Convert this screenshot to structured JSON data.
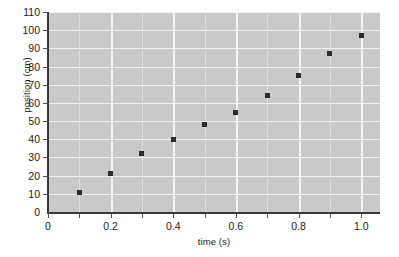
{
  "chart_data": {
    "type": "scatter",
    "title": "",
    "xlabel": "time (s)",
    "ylabel": "position (cm)",
    "xlim": [
      0,
      1.06
    ],
    "ylim": [
      0,
      110
    ],
    "grid": true,
    "legend": "none",
    "x": [
      0.1,
      0.2,
      0.3,
      0.4,
      0.5,
      0.6,
      0.7,
      0.8,
      0.9,
      1.0
    ],
    "values": [
      11,
      21,
      32,
      40,
      48,
      55,
      64,
      75,
      87,
      97
    ],
    "points": [
      {
        "x": 0.1,
        "y": 11
      },
      {
        "x": 0.2,
        "y": 21
      },
      {
        "x": 0.3,
        "y": 32
      },
      {
        "x": 0.4,
        "y": 40
      },
      {
        "x": 0.5,
        "y": 48
      },
      {
        "x": 0.6,
        "y": 55
      },
      {
        "x": 0.7,
        "y": 64
      },
      {
        "x": 0.8,
        "y": 75
      },
      {
        "x": 0.9,
        "y": 87
      },
      {
        "x": 1.0,
        "y": 97
      }
    ],
    "y_ticks": [
      0,
      10,
      20,
      30,
      40,
      50,
      60,
      70,
      80,
      90,
      100,
      110
    ],
    "y_tick_labels": [
      "0",
      "10",
      "20",
      "30",
      "40",
      "50",
      "60",
      "70",
      "80",
      "90",
      "100",
      "110"
    ],
    "x_ticks": [
      0,
      0.1,
      0.2,
      0.3,
      0.4,
      0.5,
      0.6,
      0.7,
      0.8,
      0.9,
      1.0
    ],
    "x_tick_labels": [
      "0",
      "0.2",
      "0.4",
      "0.6",
      "0.8",
      "1.0"
    ],
    "x_tick_label_values": [
      0,
      0.2,
      0.4,
      0.6,
      0.8,
      1.0
    ],
    "colors": {
      "plot_background": "#c9c9c9",
      "gridline": "#f2f2f2",
      "marker": "#2b2b2b",
      "axis": "#3a3a3a",
      "text": "#1a1a1a",
      "page_background": "#ffffff"
    }
  }
}
